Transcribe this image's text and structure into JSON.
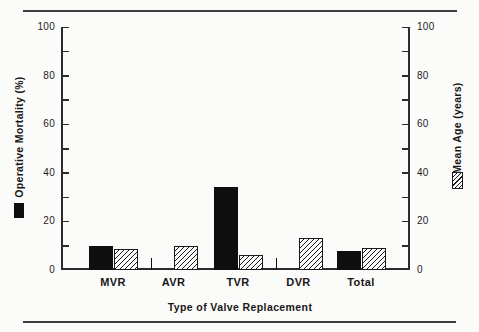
{
  "figure": {
    "left_axis": {
      "title": "Operative Mortality (%)",
      "tick_labels": [
        "0",
        "20",
        "40",
        "60",
        "80",
        "100"
      ]
    },
    "right_axis": {
      "title": "Mean Age (years)",
      "tick_labels": [
        "0",
        "20",
        "40",
        "60",
        "80",
        "100"
      ]
    },
    "x_axis_title": "Type of Valve Replacement"
  },
  "chart_data": {
    "type": "bar",
    "categories": [
      "MVR",
      "AVR",
      "TVR",
      "DVR",
      "Total"
    ],
    "series": [
      {
        "name": "Operative Mortality (%)",
        "swatch": "solid-black",
        "axis": "left",
        "values": [
          10,
          0,
          34,
          0,
          8
        ]
      },
      {
        "name": "Mean Age (years)",
        "swatch": "diagonal-hatch",
        "axis": "right",
        "values": [
          8.5,
          10,
          6,
          13,
          9
        ]
      }
    ],
    "title": "",
    "xlabel": "Type of Valve Replacement",
    "ylabel_left": "Operative Mortality (%)",
    "ylabel_right": "Mean Age (years)",
    "ylim": [
      0,
      100
    ],
    "ytick_label_step": 20,
    "ytick_minor_step": 10,
    "grid": false,
    "legend_position": "beside-axis-titles",
    "note": "Zero-value mortality bars (AVR, DVR) drawn as small ticks at baseline",
    "colors": {
      "bar_black": "#0e0e0e",
      "hatch_line": "#1a1a1a",
      "axis": "#2b2b2b",
      "text": "#1c1c1c",
      "background": "#fbfbf9"
    }
  }
}
